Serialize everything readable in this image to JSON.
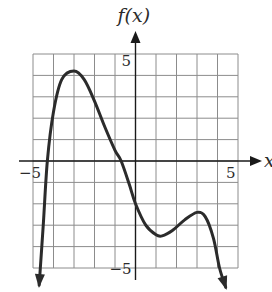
{
  "chart_data": {
    "type": "line",
    "title": "",
    "xlabel": "x",
    "ylabel": "f(x)",
    "xlim": [
      -5,
      5
    ],
    "ylim": [
      -5,
      5
    ],
    "grid": true,
    "grid_step": 1,
    "tick_labels": {
      "x_neg": "−5",
      "x_pos": "5",
      "y_pos": "5",
      "y_neg": "−5"
    },
    "series": [
      {
        "name": "f(x)",
        "end_arrows": [
          "down",
          "down"
        ],
        "points": [
          [
            -4.7,
            -5.8
          ],
          [
            -4.5,
            -3.0
          ],
          [
            -4.3,
            0.0
          ],
          [
            -4.0,
            2.3
          ],
          [
            -3.6,
            3.8
          ],
          [
            -3.0,
            4.2
          ],
          [
            -2.5,
            3.8
          ],
          [
            -2.0,
            2.8
          ],
          [
            -1.5,
            1.6
          ],
          [
            -1.0,
            0.5
          ],
          [
            -0.7,
            0.0
          ],
          [
            -0.3,
            -1.1
          ],
          [
            0.0,
            -2.0
          ],
          [
            0.5,
            -3.0
          ],
          [
            1.0,
            -3.45
          ],
          [
            1.3,
            -3.5
          ],
          [
            1.8,
            -3.25
          ],
          [
            2.4,
            -2.75
          ],
          [
            3.0,
            -2.4
          ],
          [
            3.4,
            -2.6
          ],
          [
            3.8,
            -3.6
          ],
          [
            4.1,
            -5.0
          ],
          [
            4.4,
            -5.9
          ]
        ]
      }
    ],
    "key_points": {
      "local_max": [
        -3.0,
        4.2
      ],
      "local_min": [
        1.3,
        -3.5
      ],
      "local_max_2": [
        3.0,
        -2.4
      ],
      "x_intercepts": [
        -4.3,
        -0.7
      ],
      "y_intercept": -2.0
    }
  }
}
